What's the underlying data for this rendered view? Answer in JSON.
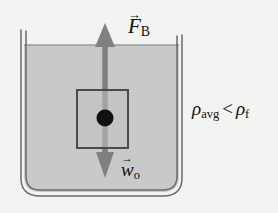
{
  "figure": {
    "background_color": "#f3f3f1"
  },
  "container": {
    "name": "beaker",
    "glass_line_color": "#6b6b6b",
    "fluid_color": "#c9c9c9",
    "fluid_surface_label": "fluid surface"
  },
  "object": {
    "name": "submerged block",
    "border_color": "#4a4a4a",
    "fill_color": "#c0c0c0",
    "center_dot_color": "#111111"
  },
  "forces": [
    {
      "id": "buoyant",
      "symbol": "F",
      "subscript": "B",
      "direction": "up",
      "arrow_color": "#808080",
      "vector_accent": "→"
    },
    {
      "id": "weight",
      "symbol": "w",
      "subscript": "o",
      "direction": "down",
      "arrow_color": "#808080",
      "vector_accent": "→"
    }
  ],
  "annotation": {
    "rho_symbol": "ρ",
    "left_subscript": "avg",
    "relation": "<",
    "right_subscript": "f",
    "full_text": "ρavg < ρf"
  }
}
